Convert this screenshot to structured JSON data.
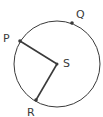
{
  "diagram": {
    "type": "circle-geometry",
    "colors": {
      "stroke": "#3a3a3a",
      "label": "#3a3a3a",
      "background": "#ffffff"
    },
    "circle": {
      "center_label": "S",
      "cx": 57,
      "cy": 64,
      "r": 43
    },
    "points": [
      {
        "id": "P",
        "label": "P",
        "x": 20,
        "y": 41,
        "label_x": 3,
        "label_y": 42
      },
      {
        "id": "Q",
        "label": "Q",
        "x": 72,
        "y": 23,
        "label_x": 76,
        "label_y": 18
      },
      {
        "id": "S",
        "label": "S",
        "x": 57,
        "y": 64,
        "label_x": 63,
        "label_y": 67
      },
      {
        "id": "R",
        "label": "R",
        "x": 36,
        "y": 100,
        "label_x": 27,
        "label_y": 116
      }
    ],
    "segments": [
      {
        "from": "P",
        "to": "S"
      },
      {
        "from": "S",
        "to": "R"
      }
    ]
  }
}
